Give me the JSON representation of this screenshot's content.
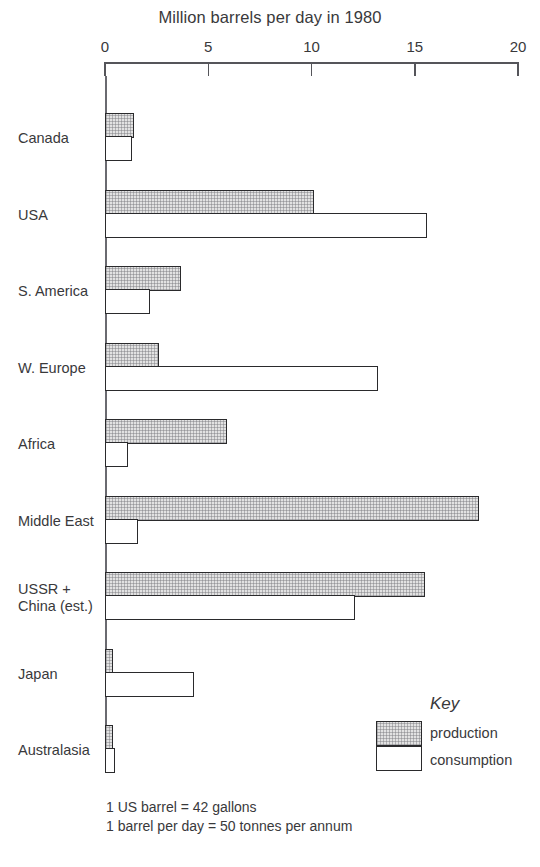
{
  "chart_data": {
    "type": "bar",
    "orientation": "horizontal",
    "title": "Million barrels per day in 1980",
    "xlabel": "",
    "ylabel": "",
    "xlim": [
      0,
      20
    ],
    "xticks": [
      0,
      5,
      10,
      15,
      20
    ],
    "xtick_labels": [
      "0",
      "5",
      "10",
      "15",
      "20"
    ],
    "grid": false,
    "legend_position": "bottom-right",
    "categories": [
      "Canada",
      "USA",
      "S. America",
      "W. Europe",
      "Africa",
      "Middle East",
      "USSR +\nChina (est.)",
      "Japan",
      "Australasia"
    ],
    "series": [
      {
        "name": "production",
        "values": [
          1.4,
          10.1,
          3.7,
          2.6,
          5.9,
          18.1,
          15.5,
          0.4,
          0.4
        ]
      },
      {
        "name": "consumption",
        "values": [
          1.3,
          15.6,
          2.2,
          13.2,
          1.1,
          1.6,
          12.1,
          4.3,
          0.5
        ]
      }
    ],
    "annotations": [
      "1 US barrel = 42 gallons",
      "1 barrel per day = 50 tonnes per annum"
    ]
  },
  "title": "Million barrels per day in 1980",
  "axis": {
    "ticks": [
      {
        "label": "0",
        "value": 0
      },
      {
        "label": "5",
        "value": 5
      },
      {
        "label": "10",
        "value": 10
      },
      {
        "label": "15",
        "value": 15
      },
      {
        "label": "20",
        "value": 20
      }
    ]
  },
  "key": {
    "title": "Key",
    "production_label": "production",
    "consumption_label": "consumption"
  },
  "footnotes": [
    "1 US barrel = 42 gallons",
    "1 barrel per day = 50 tonnes per annum"
  ],
  "colors": {
    "production_fill": "#e2e2e2",
    "consumption_fill": "#ffffff",
    "bar_outline": "#2a2a2c",
    "text": "#39393b",
    "axis": "#55555a"
  }
}
